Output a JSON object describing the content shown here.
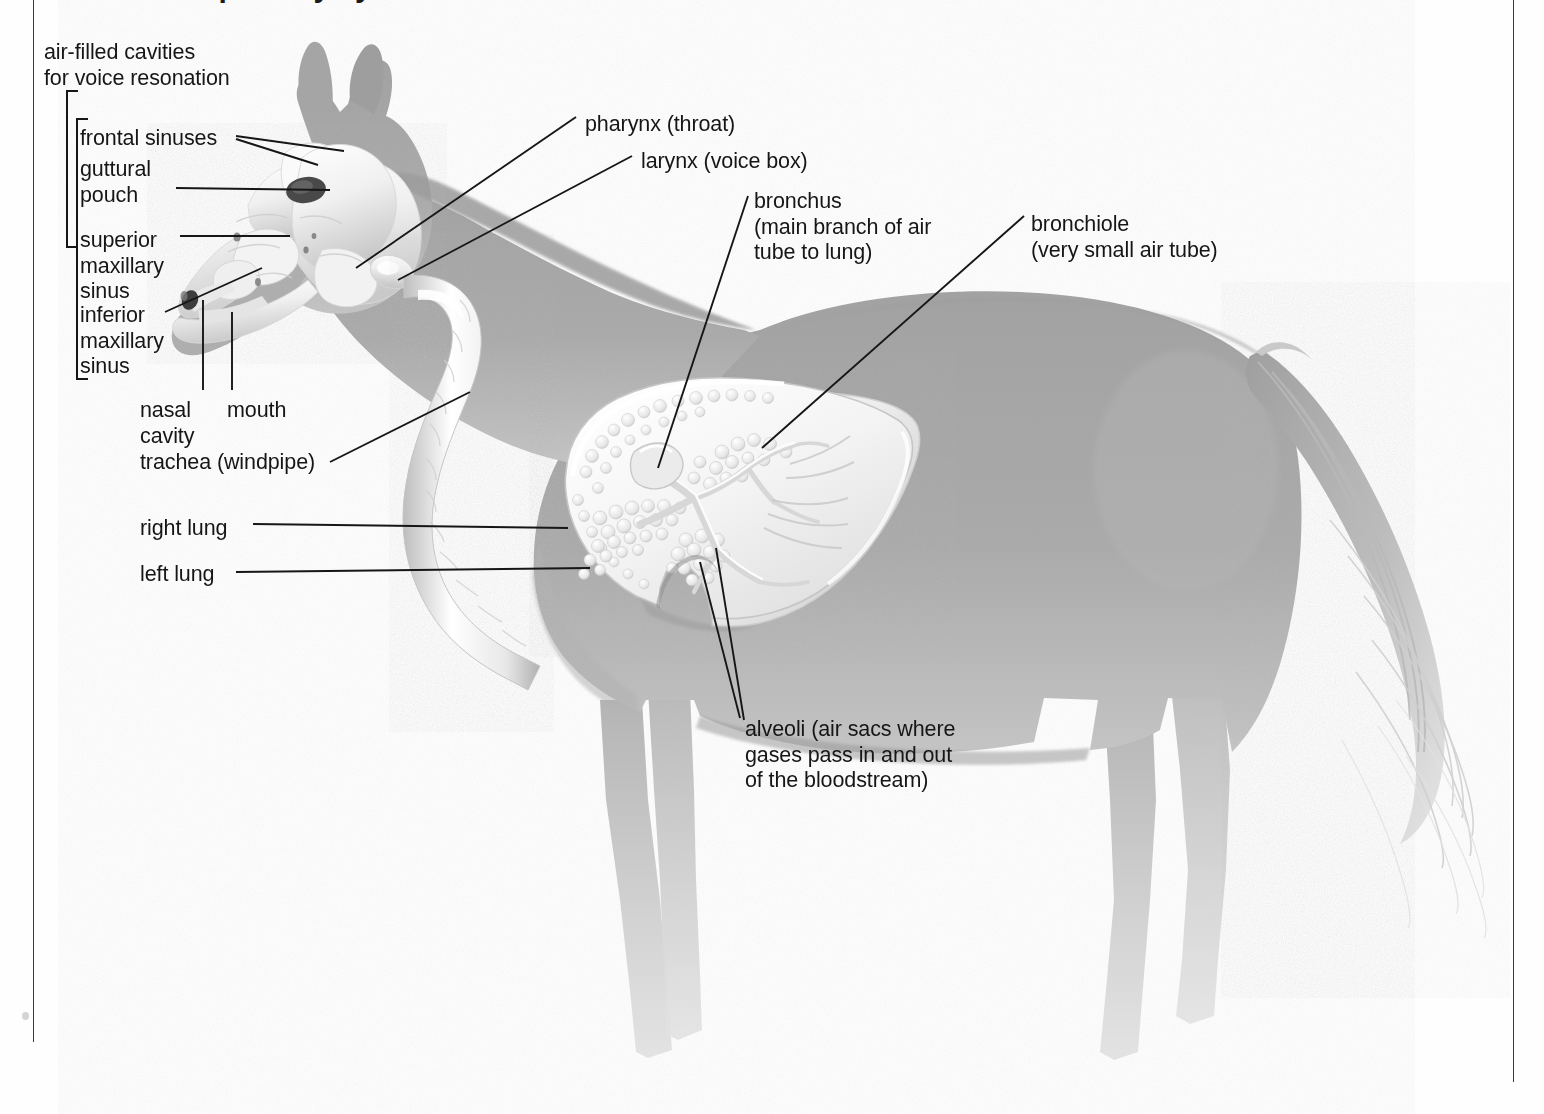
{
  "document": {
    "title_partial": "the respiratory system of the horse",
    "kind": "anatomical-diagram",
    "subject": "horse respiratory system"
  },
  "colors": {
    "ink": "#161616",
    "body_gray": "#a8a8a8",
    "body_gray_light": "#cfcfcf",
    "organ_white": "#f6f6f6",
    "organ_shadow": "#b6b6b6",
    "rule": "#3a3a3a",
    "page": "#fefefe"
  },
  "group_label": {
    "line1": "air-filled cavities",
    "line2": "for voice resonation"
  },
  "labels": [
    {
      "id": "frontal-sinuses",
      "text": "frontal sinuses",
      "lines": [
        "frontal sinuses"
      ],
      "x": 80,
      "y": 126,
      "align": "left"
    },
    {
      "id": "guttural-pouch",
      "text": "guttural pouch",
      "lines": [
        "guttural",
        "pouch"
      ],
      "x": 80,
      "y": 157,
      "align": "left"
    },
    {
      "id": "superior-maxillary-sinus",
      "text": "superior maxillary sinus",
      "lines": [
        "superior",
        "maxillary",
        "sinus"
      ],
      "x": 80,
      "y": 228,
      "align": "left"
    },
    {
      "id": "inferior-maxillary-sinus",
      "text": "inferior maxillary sinus",
      "lines": [
        "inferior",
        "maxillary",
        "sinus"
      ],
      "x": 80,
      "y": 303,
      "align": "left"
    },
    {
      "id": "nasal-cavity",
      "text": "nasal cavity",
      "lines": [
        "nasal",
        "cavity"
      ],
      "x": 140,
      "y": 398,
      "align": "left"
    },
    {
      "id": "mouth",
      "text": "mouth",
      "lines": [
        "mouth"
      ],
      "x": 227,
      "y": 398,
      "align": "left"
    },
    {
      "id": "trachea",
      "text": "trachea (windpipe)",
      "lines": [
        "trachea (windpipe)"
      ],
      "x": 140,
      "y": 450,
      "align": "left"
    },
    {
      "id": "right-lung",
      "text": "right lung",
      "lines": [
        "right lung"
      ],
      "x": 140,
      "y": 516,
      "align": "left"
    },
    {
      "id": "left-lung",
      "text": "left lung",
      "lines": [
        "left lung"
      ],
      "x": 140,
      "y": 562,
      "align": "left"
    },
    {
      "id": "pharynx",
      "text": "pharynx (throat)",
      "lines": [
        "pharynx (throat)"
      ],
      "x": 585,
      "y": 112,
      "align": "left"
    },
    {
      "id": "larynx",
      "text": "larynx (voice box)",
      "lines": [
        "larynx (voice box)"
      ],
      "x": 641,
      "y": 149,
      "align": "left"
    },
    {
      "id": "bronchus",
      "text": "bronchus (main branch of air tube to lung)",
      "lines": [
        "bronchus",
        "(main branch of air",
        "tube to lung)"
      ],
      "x": 754,
      "y": 189,
      "align": "left"
    },
    {
      "id": "bronchiole",
      "text": "bronchiole (very small air tube)",
      "lines": [
        "bronchiole",
        "(very small air tube)"
      ],
      "x": 1031,
      "y": 212,
      "align": "left"
    },
    {
      "id": "alveoli",
      "text": "alveoli (air sacs where gases pass in and out of the bloodstream)",
      "lines": [
        "alveoli (air sacs where",
        "gases pass in and out",
        "of the bloodstream)"
      ],
      "x": 745,
      "y": 717,
      "align": "left"
    }
  ],
  "brackets": [
    {
      "id": "outer-bracket",
      "x": 66,
      "y": 90,
      "width": 12,
      "height": 158
    },
    {
      "id": "inner-bracket",
      "x": 76,
      "y": 118,
      "width": 12,
      "height": 262
    }
  ],
  "anatomy_parts": [
    "skull",
    "frontal sinus",
    "guttural pouch",
    "superior maxillary sinus",
    "inferior maxillary sinus",
    "nasal cavity",
    "mouth",
    "pharynx",
    "larynx",
    "trachea",
    "right lung",
    "left lung",
    "bronchus",
    "bronchiole",
    "alveoli",
    "horse body silhouette",
    "mane",
    "tail"
  ]
}
